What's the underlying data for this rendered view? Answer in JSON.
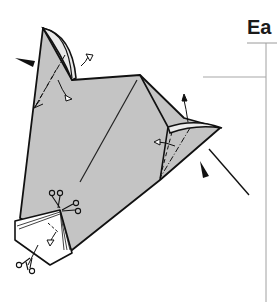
{
  "page": {
    "heading_fragment": "Ea"
  },
  "diagram": {
    "type": "origami-fold-instructions",
    "paper_color": "#c4c4c4",
    "line_color": "#111111",
    "symbols": [
      {
        "kind": "push-arrow",
        "count": 2
      },
      {
        "kind": "fold-arrow",
        "count": 4
      },
      {
        "kind": "repeat-scissors-icon",
        "count": 3
      },
      {
        "kind": "mountain-fold-line",
        "count": 2
      },
      {
        "kind": "valley-fold-line",
        "count": 2
      }
    ]
  }
}
